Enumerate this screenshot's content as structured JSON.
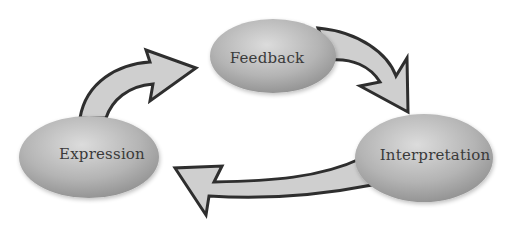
{
  "diagram": {
    "type": "cycle",
    "nodes": [
      {
        "id": "feedback",
        "label": "Feedback"
      },
      {
        "id": "interpretation",
        "label": "Interpretation"
      },
      {
        "id": "expression",
        "label": "Expression"
      }
    ],
    "edges": [
      {
        "from": "feedback",
        "to": "interpretation"
      },
      {
        "from": "interpretation",
        "to": "expression"
      },
      {
        "from": "expression",
        "to": "feedback"
      }
    ],
    "colors": {
      "node_light": "#d6d6d6",
      "node_dark": "#8c8c8c",
      "arrow_fill": "#cfcfcf",
      "arrow_stroke": "#2e2e2e",
      "text": "#3a3a3a"
    }
  }
}
